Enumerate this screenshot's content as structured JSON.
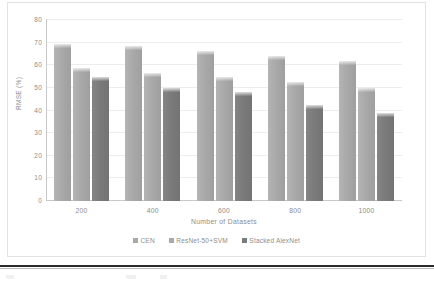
{
  "chart_data": {
    "type": "bar",
    "title": "",
    "xlabel": "Number of Datasets",
    "ylabel": "RMSE (%)",
    "categories": [
      "200",
      "400",
      "600",
      "800",
      "1000"
    ],
    "ylim": [
      0,
      80
    ],
    "yticks": [
      0,
      10,
      20,
      30,
      40,
      50,
      60,
      70,
      80
    ],
    "ytick_labels": [
      "0",
      "10",
      "20",
      "30",
      "40",
      "50",
      "60",
      "70",
      "80"
    ],
    "grid": true,
    "legend_position": "bottom",
    "series": [
      {
        "name": "CEN",
        "color": "#a9a9a9",
        "values": [
          69.5,
          68.5,
          66.5,
          64.0,
          62.0
        ]
      },
      {
        "name": "ResNet-50+SVM",
        "color": "#a9a9a9",
        "values": [
          59.0,
          56.5,
          55.0,
          52.5,
          50.0
        ]
      },
      {
        "name": "Stacked AlexNet",
        "color": "#7b7b7b",
        "values": [
          55.0,
          50.0,
          48.0,
          42.5,
          39.0
        ]
      }
    ]
  },
  "axes": {
    "y_title": "RMSE (%)",
    "x_title": "Number of Datasets"
  },
  "legend": {
    "items": [
      {
        "label": "CEN"
      },
      {
        "label": "ResNet-50+SVM"
      },
      {
        "label": "Stacked AlexNet"
      }
    ]
  }
}
